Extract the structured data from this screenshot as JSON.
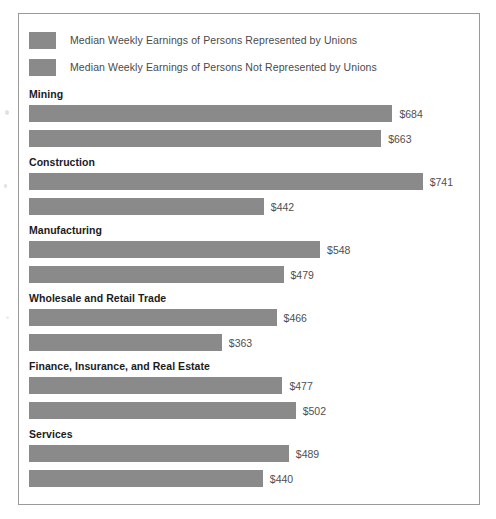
{
  "chart_data": {
    "type": "bar",
    "title": "",
    "subtitle": "",
    "xlabel": "",
    "ylabel": "",
    "orientation": "horizontal",
    "grid": false,
    "legend_position": "top-left",
    "value_prefix": "$",
    "xlim": [
      0,
      800
    ],
    "bar_color": "#8a8a8a",
    "categories": [
      "Mining",
      "Construction",
      "Manufacturing",
      "Wholesale and Retail Trade",
      "Finance, Insurance, and Real Estate",
      "Services"
    ],
    "series": [
      {
        "name": "Median Weekly Earnings of Persons Represented by Unions",
        "color": "#8a8a8a",
        "values": [
          684,
          741,
          548,
          466,
          477,
          489
        ],
        "labels": [
          "$684",
          "$741",
          "$548",
          "$466",
          "$477",
          "$489"
        ]
      },
      {
        "name": "Median Weekly Earnings of Persons Not Represented by Unions",
        "color": "#8a8a8a",
        "values": [
          663,
          442,
          479,
          363,
          502,
          440
        ],
        "labels": [
          "$663",
          "$442",
          "$479",
          "$363",
          "$502",
          "$440"
        ]
      }
    ]
  },
  "legend": {
    "items": [
      {
        "label": "Median Weekly Earnings of Persons Represented by Unions",
        "color": "#8a8a8a"
      },
      {
        "label": "Median Weekly Earnings of Persons Not Represented by Unions",
        "color": "#8a8a8a"
      }
    ]
  },
  "groups": [
    {
      "title": "Mining",
      "bars": [
        {
          "label": "$684",
          "value": 684,
          "series": "union"
        },
        {
          "label": "$663",
          "value": 663,
          "series": "nonunion"
        }
      ]
    },
    {
      "title": "Construction",
      "bars": [
        {
          "label": "$741",
          "value": 741,
          "series": "union"
        },
        {
          "label": "$442",
          "value": 442,
          "series": "nonunion"
        }
      ]
    },
    {
      "title": "Manufacturing",
      "bars": [
        {
          "label": "$548",
          "value": 548,
          "series": "union"
        },
        {
          "label": "$479",
          "value": 479,
          "series": "nonunion"
        }
      ]
    },
    {
      "title": "Wholesale and Retail Trade",
      "bars": [
        {
          "label": "$466",
          "value": 466,
          "series": "union"
        },
        {
          "label": "$363",
          "value": 363,
          "series": "nonunion"
        }
      ]
    },
    {
      "title": "Finance, Insurance, and Real Estate",
      "bars": [
        {
          "label": "$477",
          "value": 477,
          "series": "union"
        },
        {
          "label": "$502",
          "value": 502,
          "series": "nonunion"
        }
      ]
    },
    {
      "title": "Services",
      "bars": [
        {
          "label": "$489",
          "value": 489,
          "series": "union"
        },
        {
          "label": "$440",
          "value": 440,
          "series": "nonunion"
        }
      ]
    }
  ]
}
